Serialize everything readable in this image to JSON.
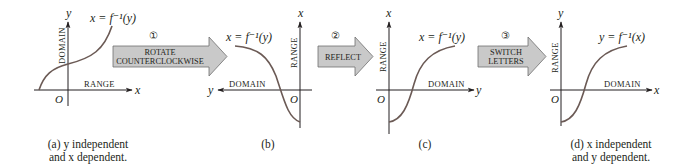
{
  "steps": [
    {
      "number": "①",
      "label_line1": "ROTATE",
      "label_line2": "COUNTERCLOCKWISE"
    },
    {
      "number": "②",
      "label_line1": "REFLECT",
      "label_line2": ""
    },
    {
      "number": "③",
      "label_line1": "SWITCH",
      "label_line2": "LETTERS"
    }
  ],
  "panels": [
    {
      "id": "a",
      "equation": "x = f⁻¹(y)",
      "vertical_axis_var": "y",
      "horizontal_axis_var": "x",
      "origin": "O",
      "vertical_axis_label": "DOMAIN",
      "horizontal_axis_label": "RANGE",
      "caption_line1": "(a) y independent",
      "caption_line2": "and x dependent."
    },
    {
      "id": "b",
      "equation": "x = f⁻¹(y)",
      "vertical_axis_var": "x",
      "horizontal_axis_var": "y",
      "origin": "O",
      "vertical_axis_label": "RANGE",
      "horizontal_axis_label": "DOMAIN",
      "caption_line1": "(b)",
      "caption_line2": ""
    },
    {
      "id": "c",
      "equation": "x = f⁻¹(y)",
      "vertical_axis_var": "x",
      "horizontal_axis_var": "y",
      "origin": "O",
      "vertical_axis_label": "RANGE",
      "horizontal_axis_label": "DOMAIN",
      "caption_line1": "(c)",
      "caption_line2": ""
    },
    {
      "id": "d",
      "equation": "y = f⁻¹(x)",
      "vertical_axis_var": "y",
      "horizontal_axis_var": "x",
      "origin": "O",
      "vertical_axis_label": "RANGE",
      "horizontal_axis_label": "DOMAIN",
      "caption_line1": "(d) x independent",
      "caption_line2": "and y dependent."
    }
  ],
  "colors": {
    "ink": "#231f20",
    "curve": "#6b5a55",
    "arrow_fill": "#c9c9c9",
    "arrow_stroke": "#6f6f6f"
  }
}
